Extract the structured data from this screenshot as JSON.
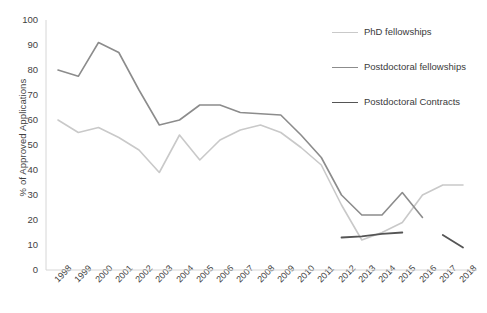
{
  "chart_data": {
    "type": "line",
    "title": "",
    "xlabel": "",
    "ylabel": "% of Approved Applications",
    "ylim": [
      0,
      100
    ],
    "ytick_step": 10,
    "grid": false,
    "legend_position": "top-right",
    "yticks": [
      "100",
      "90",
      "80",
      "70",
      "60",
      "50",
      "40",
      "30",
      "20",
      "10",
      "0"
    ],
    "categories": [
      "1998",
      "1999",
      "2000",
      "2001",
      "2002",
      "2003",
      "2004",
      "2005",
      "2006",
      "2007",
      "2008",
      "2009",
      "2010",
      "2011",
      "2012",
      "2013",
      "2014",
      "2015",
      "2016",
      "2017",
      "2018"
    ],
    "series": [
      {
        "name": "PhD fellowships",
        "color": "#c9c9c9",
        "width": 1.6,
        "values": [
          60,
          55,
          57,
          53,
          48,
          39,
          54,
          44,
          52,
          56,
          58,
          55,
          49,
          42,
          26,
          12,
          15,
          19,
          30,
          34,
          34
        ]
      },
      {
        "name": "Postdoctoral fellowships",
        "color": "#8c8c8c",
        "width": 1.6,
        "values": [
          80,
          77.5,
          91,
          87,
          72,
          58,
          60,
          66,
          66,
          63,
          62.5,
          62,
          54,
          45,
          30,
          22,
          22,
          31,
          21,
          null,
          null
        ]
      },
      {
        "name": "Postdoctoral Contracts",
        "color": "#555555",
        "width": 1.8,
        "values": [
          null,
          null,
          null,
          null,
          null,
          null,
          null,
          null,
          null,
          null,
          null,
          null,
          null,
          null,
          13,
          13.5,
          14.5,
          15,
          null,
          14,
          9
        ]
      }
    ]
  },
  "legend": {
    "items": [
      {
        "label": "PhD fellowships"
      },
      {
        "label": "Postdoctoral fellowships"
      },
      {
        "label": "Postdoctoral Contracts"
      }
    ]
  }
}
